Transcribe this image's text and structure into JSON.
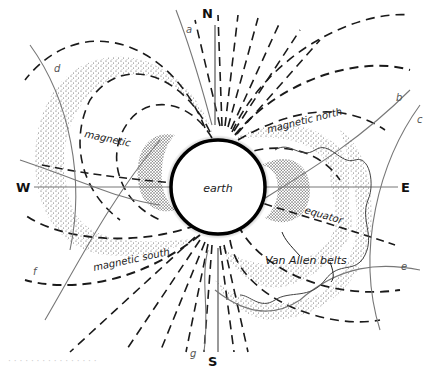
{
  "diagram": {
    "center_label": "earth",
    "compass": {
      "north": "N",
      "south": "S",
      "east": "E",
      "west": "W"
    },
    "labels": {
      "magnetic": "magnetic",
      "magnetic_north": "magnetic north",
      "magnetic_south": "magnetic south",
      "equator": "equator",
      "van_allen_belts": "Van Allen belts"
    },
    "trajectory_letters": [
      "a",
      "b",
      "c",
      "d",
      "e",
      "f",
      "g"
    ],
    "colors": {
      "ink": "#1a1a1a",
      "trajectory": "#777777",
      "background": "#ffffff",
      "stipple": "#333333"
    }
  },
  "caption": "· ·  ·    ·   ·       ·   ·     ·    ·   ·       ·     ·   ·       ·    ·   ·"
}
